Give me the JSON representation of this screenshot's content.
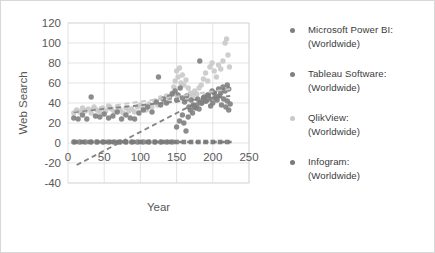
{
  "figure": {
    "border_color": "#d8d8d8",
    "background": "#ffffff"
  },
  "legend": {
    "position": "right",
    "items": [
      {
        "label_line1": "Microsoft Power BI:",
        "label_line2": "(Worldwide)",
        "color": "#7f7f7f"
      },
      {
        "label_line1": "Tableau Software:",
        "label_line2": "(Worldwide)",
        "color": "#808080"
      },
      {
        "label_line1": "QlikView:",
        "label_line2": "(Worldwide)",
        "color": "#c9c9c9"
      },
      {
        "label_line1": "Infogram:",
        "label_line2": "(Worldwide)",
        "color": "#7a7a7a"
      }
    ]
  },
  "axes": {
    "x_label": "Year",
    "y_label": "Web Search",
    "x_ticks": [
      "0",
      "50",
      "100",
      "150",
      "200",
      "250"
    ],
    "y_ticks": [
      "120",
      "100",
      "80",
      "60",
      "40",
      "20",
      "0",
      "-20",
      "-40"
    ],
    "tick_color": "#595959",
    "grid_color": "#d9d9d9"
  },
  "chart_data": {
    "type": "scatter",
    "title": "",
    "xlabel": "Year",
    "ylabel": "Web Search",
    "xlim": [
      0,
      250
    ],
    "ylim": [
      -40,
      120
    ],
    "xticks": [
      0,
      50,
      100,
      150,
      200,
      250
    ],
    "yticks": [
      -40,
      -20,
      0,
      20,
      40,
      60,
      80,
      100,
      120
    ],
    "grid": true,
    "legend_position": "right",
    "series": [
      {
        "name": "Microsoft Power BI: (Worldwide)",
        "color": "#7f7f7f",
        "marker": "circle",
        "trendline": {
          "type": "linear",
          "style": "dashed",
          "x0": 12,
          "y0": -22,
          "x1": 222,
          "y1": 57
        },
        "points": [
          [
            8,
            1
          ],
          [
            16,
            1
          ],
          [
            24,
            1
          ],
          [
            32,
            1
          ],
          [
            40,
            1
          ],
          [
            48,
            1
          ],
          [
            56,
            1
          ],
          [
            64,
            1
          ],
          [
            72,
            1
          ],
          [
            80,
            1
          ],
          [
            88,
            1
          ],
          [
            96,
            1
          ],
          [
            104,
            1
          ],
          [
            112,
            1
          ],
          [
            120,
            1
          ],
          [
            128,
            1
          ],
          [
            136,
            1
          ],
          [
            144,
            1
          ],
          [
            150,
            16
          ],
          [
            154,
            22
          ],
          [
            158,
            28
          ],
          [
            160,
            20
          ],
          [
            163,
            12
          ],
          [
            166,
            26
          ],
          [
            169,
            33
          ],
          [
            172,
            30
          ],
          [
            175,
            36
          ],
          [
            178,
            38
          ],
          [
            181,
            34
          ],
          [
            184,
            40
          ],
          [
            187,
            45
          ],
          [
            190,
            42
          ],
          [
            193,
            48
          ],
          [
            196,
            44
          ],
          [
            199,
            52
          ],
          [
            202,
            50
          ],
          [
            205,
            46
          ],
          [
            208,
            54
          ],
          [
            211,
            50
          ],
          [
            214,
            56
          ],
          [
            217,
            52
          ],
          [
            220,
            58
          ],
          [
            222,
            54
          ]
        ]
      },
      {
        "name": "Tableau Software: (Worldwide)",
        "color": "#808080",
        "marker": "circle",
        "trendline": {
          "type": "linear",
          "style": "dashed",
          "x0": 8,
          "y0": 31,
          "x1": 224,
          "y1": 47
        },
        "points": [
          [
            8,
            25
          ],
          [
            14,
            24
          ],
          [
            20,
            28
          ],
          [
            26,
            24
          ],
          [
            32,
            46
          ],
          [
            38,
            27
          ],
          [
            44,
            26
          ],
          [
            50,
            29
          ],
          [
            56,
            25
          ],
          [
            62,
            27
          ],
          [
            68,
            31
          ],
          [
            74,
            24
          ],
          [
            80,
            28
          ],
          [
            86,
            25
          ],
          [
            92,
            24
          ],
          [
            98,
            30
          ],
          [
            104,
            33
          ],
          [
            110,
            36
          ],
          [
            116,
            31
          ],
          [
            122,
            41
          ],
          [
            125,
            66
          ],
          [
            128,
            38
          ],
          [
            132,
            44
          ],
          [
            136,
            40
          ],
          [
            140,
            46
          ],
          [
            144,
            49
          ],
          [
            148,
            52
          ],
          [
            150,
            43
          ],
          [
            152,
            48
          ],
          [
            155,
            55
          ],
          [
            158,
            45
          ],
          [
            161,
            41
          ],
          [
            164,
            47
          ],
          [
            167,
            36
          ],
          [
            170,
            43
          ],
          [
            173,
            38
          ],
          [
            176,
            35
          ],
          [
            179,
            44
          ],
          [
            182,
            82
          ],
          [
            185,
            40
          ],
          [
            188,
            46
          ],
          [
            191,
            42
          ],
          [
            194,
            48
          ],
          [
            197,
            37
          ],
          [
            200,
            40
          ],
          [
            203,
            45
          ],
          [
            206,
            43
          ],
          [
            209,
            47
          ],
          [
            212,
            38
          ],
          [
            215,
            44
          ],
          [
            218,
            36
          ],
          [
            220,
            42
          ],
          [
            222,
            33
          ],
          [
            224,
            39
          ]
        ]
      },
      {
        "name": "QlikView: (Worldwide)",
        "color": "#c9c9c9",
        "marker": "circle",
        "trendline": {
          "type": "linear",
          "style": "dashed",
          "x0": 8,
          "y0": 32,
          "x1": 224,
          "y1": 54
        },
        "points": [
          [
            8,
            30
          ],
          [
            12,
            33
          ],
          [
            16,
            31
          ],
          [
            20,
            35
          ],
          [
            24,
            32
          ],
          [
            28,
            34
          ],
          [
            32,
            30
          ],
          [
            36,
            36
          ],
          [
            40,
            33
          ],
          [
            44,
            31
          ],
          [
            48,
            35
          ],
          [
            52,
            32
          ],
          [
            56,
            37
          ],
          [
            60,
            34
          ],
          [
            64,
            31
          ],
          [
            68,
            36
          ],
          [
            72,
            33
          ],
          [
            76,
            30
          ],
          [
            80,
            35
          ],
          [
            84,
            32
          ],
          [
            88,
            34
          ],
          [
            92,
            31
          ],
          [
            96,
            36
          ],
          [
            100,
            38
          ],
          [
            104,
            35
          ],
          [
            108,
            33
          ],
          [
            112,
            39
          ],
          [
            116,
            36
          ],
          [
            120,
            42
          ],
          [
            124,
            38
          ],
          [
            128,
            45
          ],
          [
            132,
            41
          ],
          [
            136,
            47
          ],
          [
            140,
            44
          ],
          [
            144,
            50
          ],
          [
            146,
            56
          ],
          [
            148,
            62
          ],
          [
            150,
            72
          ],
          [
            152,
            66
          ],
          [
            154,
            75
          ],
          [
            156,
            60
          ],
          [
            158,
            68
          ],
          [
            160,
            58
          ],
          [
            163,
            63
          ],
          [
            166,
            55
          ],
          [
            169,
            50
          ],
          [
            172,
            47
          ],
          [
            175,
            52
          ],
          [
            178,
            49
          ],
          [
            181,
            55
          ],
          [
            184,
            58
          ],
          [
            187,
            64
          ],
          [
            190,
            70
          ],
          [
            193,
            62
          ],
          [
            196,
            76
          ],
          [
            199,
            80
          ],
          [
            202,
            72
          ],
          [
            205,
            66
          ],
          [
            208,
            78
          ],
          [
            211,
            74
          ],
          [
            214,
            82
          ],
          [
            217,
            100
          ],
          [
            219,
            104
          ],
          [
            221,
            88
          ],
          [
            223,
            76
          ]
        ]
      },
      {
        "name": "Infogram: (Worldwide)",
        "color": "#7a7a7a",
        "marker": "square",
        "trendline": {
          "type": "linear",
          "style": "dashed",
          "x0": 6,
          "y0": 1,
          "x1": 226,
          "y1": 1
        },
        "points": [
          [
            10,
            1
          ],
          [
            20,
            1
          ],
          [
            30,
            1
          ],
          [
            40,
            1
          ],
          [
            50,
            1
          ],
          [
            60,
            1
          ],
          [
            70,
            1
          ],
          [
            80,
            1
          ],
          [
            90,
            1
          ],
          [
            100,
            1
          ],
          [
            110,
            1
          ],
          [
            120,
            1
          ],
          [
            130,
            1
          ],
          [
            140,
            1
          ],
          [
            150,
            1
          ],
          [
            160,
            1
          ],
          [
            170,
            1
          ],
          [
            180,
            1
          ],
          [
            190,
            1
          ],
          [
            200,
            1
          ],
          [
            210,
            1
          ],
          [
            220,
            1
          ]
        ]
      }
    ]
  }
}
